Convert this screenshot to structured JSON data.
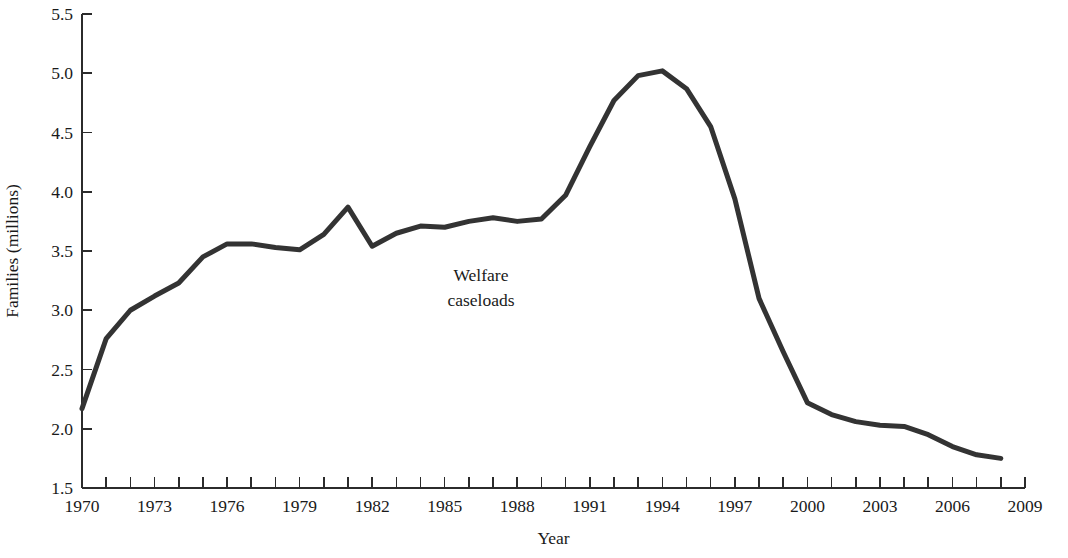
{
  "chart_data": {
    "type": "line",
    "title": "",
    "xlabel": "Year",
    "ylabel": "Families (millions)",
    "xlim": [
      1970,
      2009
    ],
    "ylim": [
      1.5,
      5.5
    ],
    "grid": false,
    "legend_position": "none",
    "annotations": [
      {
        "text": "Welfare caseloads",
        "line1": "Welfare",
        "line2": "caseloads",
        "x": 1986.5,
        "y": 3.25
      }
    ],
    "x_tick_labels": [
      "1970",
      "1973",
      "1976",
      "1979",
      "1982",
      "1985",
      "1988",
      "1991",
      "1994",
      "1997",
      "2000",
      "2003",
      "2006",
      "2009"
    ],
    "x_tick_values": [
      1970,
      1973,
      1976,
      1979,
      1982,
      1985,
      1988,
      1991,
      1994,
      1997,
      2000,
      2003,
      2006,
      2009
    ],
    "x_minor_ticks": [
      1970,
      1971,
      1972,
      1973,
      1974,
      1975,
      1976,
      1977,
      1978,
      1979,
      1980,
      1981,
      1982,
      1983,
      1984,
      1985,
      1986,
      1987,
      1988,
      1989,
      1990,
      1991,
      1992,
      1993,
      1994,
      1995,
      1996,
      1997,
      1998,
      1999,
      2000,
      2001,
      2002,
      2003,
      2004,
      2005,
      2006,
      2007,
      2008,
      2009
    ],
    "y_tick_labels": [
      "1.5",
      "2.0",
      "2.5",
      "3.0",
      "3.5",
      "4.0",
      "4.5",
      "5.0",
      "5.5"
    ],
    "y_tick_values": [
      1.5,
      2.0,
      2.5,
      3.0,
      3.5,
      4.0,
      4.5,
      5.0,
      5.5
    ],
    "series": [
      {
        "name": "Welfare caseloads",
        "color": "#333333",
        "stroke_width": 5,
        "x": [
          1970,
          1971,
          1972,
          1973,
          1974,
          1975,
          1976,
          1977,
          1978,
          1979,
          1980,
          1981,
          1982,
          1983,
          1984,
          1985,
          1986,
          1987,
          1988,
          1989,
          1990,
          1991,
          1992,
          1993,
          1994,
          1995,
          1996,
          1997,
          1998,
          1999,
          2000,
          2001,
          2002,
          2003,
          2004,
          2005,
          2006,
          2007,
          2008
        ],
        "values": [
          2.17,
          2.76,
          3.0,
          3.12,
          3.23,
          3.45,
          3.56,
          3.56,
          3.53,
          3.51,
          3.64,
          3.87,
          3.54,
          3.65,
          3.71,
          3.7,
          3.75,
          3.78,
          3.75,
          3.77,
          3.97,
          4.38,
          4.77,
          4.98,
          5.02,
          4.87,
          4.55,
          3.94,
          3.1,
          2.65,
          2.22,
          2.12,
          2.06,
          2.03,
          2.02,
          1.95,
          1.85,
          1.78,
          1.75
        ]
      }
    ]
  }
}
